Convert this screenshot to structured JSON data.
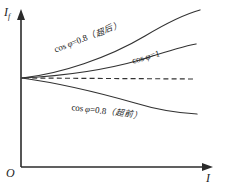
{
  "figure": {
    "background_color": "#ffffff",
    "axis_color": "#2b2b2b",
    "curve_color": "#333333"
  },
  "axes": {
    "y_label": "I",
    "y_label_sub": "f",
    "x_label": "I",
    "origin_label": "O"
  },
  "labels": {
    "lagging": {
      "fn": "cos",
      "phi": "φ",
      "eq": "=0.8",
      "cjk": "（超后）"
    },
    "unity": {
      "fn": "cos",
      "phi": "φ",
      "eq": "=1",
      "cjk": ""
    },
    "leading": {
      "fn": "cos",
      "phi": "φ",
      "eq": "=0.8",
      "cjk": "（超前）"
    }
  },
  "chart_data": {
    "type": "line",
    "title": "",
    "xlabel": "I",
    "ylabel": "I_f",
    "xlim": [
      0,
      225
    ],
    "ylim": [
      0,
      193
    ],
    "grid": false,
    "legend": "inline-annotations",
    "origin": {
      "x": 21,
      "y": 167
    },
    "convergence_point": {
      "x": 22,
      "y": 78
    },
    "series": [
      {
        "name": "cos φ=0.8 (超后 / lagging)",
        "style": "solid",
        "path": "M22,78 C60,74 108,58 145,36 C165,24 182,15 200,10",
        "points": [
          [
            22,
            78
          ],
          [
            60,
            74
          ],
          [
            108,
            58
          ],
          [
            145,
            36
          ],
          [
            200,
            10
          ]
        ]
      },
      {
        "name": "cos φ=1 (unity)",
        "style": "solid",
        "path": "M22,78 C62,76 105,70 140,60 C162,53 180,47 196,44",
        "points": [
          [
            22,
            78
          ],
          [
            62,
            76
          ],
          [
            105,
            70
          ],
          [
            140,
            60
          ],
          [
            196,
            44
          ]
        ]
      },
      {
        "name": "reference (dashed)",
        "style": "dashed",
        "path": "M24,78 L196,79",
        "points": [
          [
            24,
            78
          ],
          [
            196,
            79
          ]
        ]
      },
      {
        "name": "cos φ=0.8 (超前 / leading)",
        "style": "solid",
        "path": "M22,78 C58,83 100,93 135,103 C158,110 178,113 197,114",
        "points": [
          [
            22,
            78
          ],
          [
            58,
            83
          ],
          [
            100,
            93
          ],
          [
            135,
            103
          ],
          [
            197,
            114
          ]
        ]
      }
    ]
  }
}
